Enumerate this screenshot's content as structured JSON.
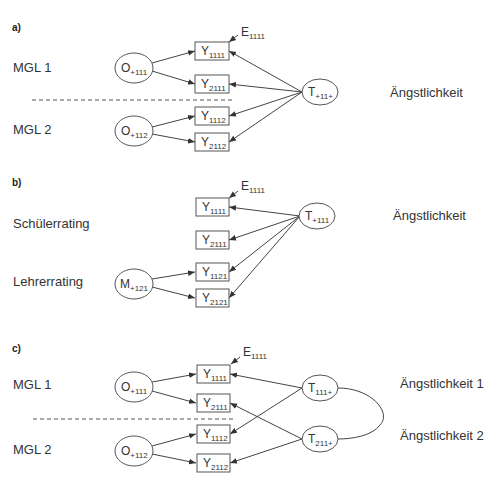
{
  "panels": [
    {
      "label": "a)",
      "groups": [
        "MGL 1",
        "MGL 2"
      ],
      "trait_label": "Ängstlichkeit",
      "error_label": {
        "base": "E",
        "sub": "1111"
      },
      "indicators": [
        {
          "base": "Y",
          "sub": "1111"
        },
        {
          "base": "Y",
          "sub": "2111"
        },
        {
          "base": "Y",
          "sub": "1112"
        },
        {
          "base": "Y",
          "sub": "2112"
        }
      ],
      "method_factors": [
        {
          "base": "O",
          "sub": "+111"
        },
        {
          "base": "O",
          "sub": "+112"
        }
      ],
      "trait_factors": [
        {
          "base": "T",
          "sub": "+11+"
        }
      ]
    },
    {
      "label": "b)",
      "groups": [
        "Schülerrating",
        "Lehrerrating"
      ],
      "trait_label": "Ängstlichkeit",
      "error_label": {
        "base": "E",
        "sub": "1111"
      },
      "indicators": [
        {
          "base": "Y",
          "sub": "1111"
        },
        {
          "base": "Y",
          "sub": "2111"
        },
        {
          "base": "Y",
          "sub": "1121"
        },
        {
          "base": "Y",
          "sub": "2121"
        }
      ],
      "method_factors": [
        {
          "base": "M",
          "sub": "+121"
        }
      ],
      "trait_factors": [
        {
          "base": "T",
          "sub": "+111"
        }
      ]
    },
    {
      "label": "c)",
      "groups": [
        "MGL 1",
        "MGL 2"
      ],
      "trait_labels": [
        "Ängstlichkeit 1",
        "Ängstlichkeit 2"
      ],
      "error_label": {
        "base": "E",
        "sub": "1111"
      },
      "indicators": [
        {
          "base": "Y",
          "sub": "1111"
        },
        {
          "base": "Y",
          "sub": "2111"
        },
        {
          "base": "Y",
          "sub": "1112"
        },
        {
          "base": "Y",
          "sub": "2112"
        }
      ],
      "method_factors": [
        {
          "base": "O",
          "sub": "+111"
        },
        {
          "base": "O",
          "sub": "+112"
        }
      ],
      "trait_factors": [
        {
          "base": "T",
          "sub": "111+"
        },
        {
          "base": "T",
          "sub": "211+"
        }
      ]
    }
  ]
}
